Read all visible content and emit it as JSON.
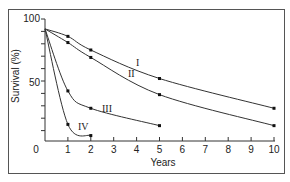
{
  "chart_data": {
    "type": "line",
    "title": "",
    "xlabel": "Years",
    "ylabel": "Survival (%)",
    "xlim": [
      0,
      10
    ],
    "ylim": [
      0,
      100
    ],
    "x_ticks": [
      0,
      1,
      2,
      3,
      4,
      5,
      6,
      7,
      8,
      9,
      10
    ],
    "x_tick_labels": [
      "0",
      "1",
      "2",
      "3",
      "4",
      "5",
      "6",
      "7",
      "8",
      "9",
      "10"
    ],
    "y_ticks": [
      10,
      20,
      30,
      40,
      50,
      60,
      70,
      80,
      90,
      100
    ],
    "y_tick_labels": [
      "50",
      "100"
    ],
    "grid": false,
    "legend": "inline labels",
    "series": [
      {
        "name": "I",
        "x": [
          0,
          1,
          2,
          5,
          10
        ],
        "values": [
          92,
          86,
          75,
          52,
          28
        ]
      },
      {
        "name": "II",
        "x": [
          0,
          1,
          2,
          5,
          10
        ],
        "values": [
          92,
          81,
          69,
          39,
          14
        ]
      },
      {
        "name": "III",
        "x": [
          0,
          1,
          2,
          5
        ],
        "values": [
          92,
          42,
          28,
          14
        ]
      },
      {
        "name": "IV",
        "x": [
          0,
          1,
          2
        ],
        "values": [
          92,
          15,
          6
        ]
      }
    ]
  },
  "labels": {
    "x_axis_title": "Years",
    "y_axis_title": "Survival (%)",
    "y_tick_100": "100",
    "y_tick_50": "50",
    "curve_I": "I",
    "curve_II": "II",
    "curve_III": "III",
    "curve_IV": "IV"
  }
}
